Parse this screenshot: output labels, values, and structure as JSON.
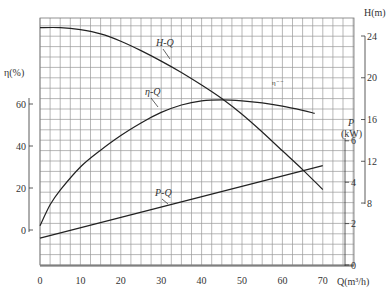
{
  "chart_data": {
    "type": "line",
    "title": "",
    "xlabel": "Q(m³/h)",
    "x_axis": {
      "label": "Q(m³/h)",
      "ticks": [
        0,
        10,
        20,
        30,
        40,
        50,
        60,
        70
      ],
      "range": [
        0,
        75
      ]
    },
    "y_axes": [
      {
        "id": "eta",
        "label": "η(%)",
        "side": "left",
        "ticks": [
          0,
          20,
          40,
          60
        ],
        "range": [
          0,
          60
        ]
      },
      {
        "id": "P",
        "label": "P (kW)",
        "side": "right-inner",
        "ticks": [
          0,
          2,
          4,
          6
        ],
        "range": [
          0,
          6
        ]
      },
      {
        "id": "H",
        "label": "H(m)",
        "side": "right-outer",
        "ticks": [
          8,
          12,
          16,
          20,
          24
        ],
        "range": [
          8,
          24
        ]
      }
    ],
    "grid": true,
    "series": [
      {
        "name": "H-Q",
        "axis": "H",
        "x": [
          0,
          5,
          10,
          15,
          20,
          25,
          30,
          35,
          40,
          45,
          50,
          55,
          60,
          65,
          70
        ],
        "values": [
          24.8,
          24.8,
          24.6,
          24.2,
          23.5,
          22.6,
          21.6,
          20.5,
          19.3,
          18.0,
          16.5,
          14.8,
          13.0,
          11.2,
          9.3
        ]
      },
      {
        "name": "η-Q",
        "axis": "eta",
        "x": [
          0,
          2.5,
          5,
          10,
          15,
          20,
          25,
          30,
          35,
          40,
          45,
          50,
          55,
          60,
          65,
          68
        ],
        "values": [
          2,
          12,
          19,
          30,
          38,
          45,
          51,
          56,
          59.5,
          61.5,
          62,
          61.5,
          60.5,
          59,
          57,
          55.5
        ]
      },
      {
        "name": "P-Q",
        "axis": "P",
        "x": [
          0,
          70
        ],
        "values": [
          1.3,
          4.8
        ]
      }
    ],
    "annotations": [
      "H-Q",
      "η-Q",
      "P-Q",
      "η"
    ]
  },
  "labels": {
    "eta_axis": "η(%)",
    "h_axis": "H(m)",
    "p_axis_1": "P",
    "p_axis_2": "(kW)",
    "q_axis": "Q(m³/h)",
    "curve_hq": "H-Q",
    "curve_etaq": "η-Q",
    "curve_pq": "P-Q",
    "curve_eta_small": "η⁻⁻"
  },
  "ticks": {
    "x": [
      "0",
      "10",
      "20",
      "30",
      "40",
      "50",
      "60",
      "70"
    ],
    "eta": [
      "0",
      "20",
      "40",
      "60"
    ],
    "p": [
      "0",
      "2",
      "4",
      "6"
    ],
    "h": [
      "8",
      "12",
      "16",
      "20",
      "24"
    ]
  }
}
